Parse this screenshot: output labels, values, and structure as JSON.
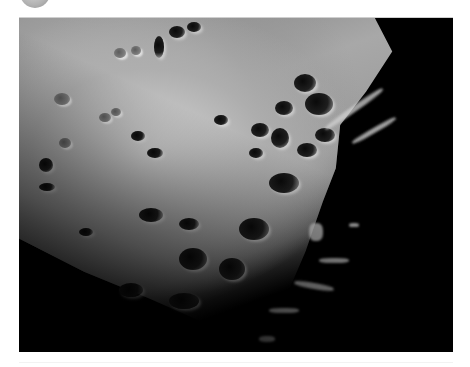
{
  "image": {
    "subject": "lunar surface photograph",
    "description": "Grayscale telescopic photo of heavily cratered Moon surface near the terminator, lit region upper-left fading into black shadow lower-right",
    "colors": {
      "background": "#ffffff",
      "space": "#000000",
      "surface_light": "#c8c8c8",
      "surface_mid": "#9a9a9a",
      "crater_shadow": "#111111"
    }
  },
  "decorations": {
    "top_circle": "partially visible grey circle at top-left edge"
  }
}
